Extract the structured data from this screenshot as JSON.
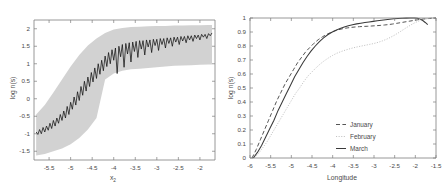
{
  "figure": {
    "title": "",
    "panels": [
      "left",
      "right"
    ]
  },
  "chart_data": [
    {
      "type": "line",
      "panel": "left",
      "title": "",
      "xlabel": "x2",
      "xlabel_display": "x",
      "xlabel_sub": "2",
      "ylabel": "log n(s)",
      "xlim": [
        -5.85,
        -1.65
      ],
      "ylim": [
        -1.75,
        2.25
      ],
      "xticks": [
        -5.5,
        -5,
        -4.5,
        -4,
        -3.5,
        -3,
        -2.5,
        -2
      ],
      "xticklabels": [
        "-5.5",
        "-5",
        "-4.5",
        "-4",
        "-3.5",
        "-3",
        "-2.5",
        "-2"
      ],
      "yticks": [
        2,
        1.5,
        1,
        0.5,
        0,
        -0.5,
        -1,
        -1.5
      ],
      "yticklabels": [
        "2",
        "1.5",
        "1",
        "0.5",
        "0",
        "-0.5",
        "-1",
        "-1.5"
      ],
      "grid": false,
      "legend": "none",
      "series": [
        {
          "name": "mean",
          "style": "solid-black-noisy",
          "x": [
            -5.8,
            -5.76,
            -5.72,
            -5.68,
            -5.64,
            -5.6,
            -5.56,
            -5.52,
            -5.48,
            -5.44,
            -5.4,
            -5.36,
            -5.32,
            -5.28,
            -5.24,
            -5.2,
            -5.16,
            -5.12,
            -5.08,
            -5.04,
            -5.0,
            -4.96,
            -4.92,
            -4.88,
            -4.84,
            -4.8,
            -4.76,
            -4.72,
            -4.68,
            -4.64,
            -4.6,
            -4.56,
            -4.52,
            -4.48,
            -4.44,
            -4.4,
            -4.36,
            -4.32,
            -4.28,
            -4.24,
            -4.2,
            -4.16,
            -4.12,
            -4.08,
            -4.04,
            -4.0,
            -3.96,
            -3.92,
            -3.88,
            -3.84,
            -3.8,
            -3.76,
            -3.72,
            -3.68,
            -3.64,
            -3.6,
            -3.56,
            -3.52,
            -3.48,
            -3.44,
            -3.4,
            -3.36,
            -3.32,
            -3.28,
            -3.24,
            -3.2,
            -3.16,
            -3.12,
            -3.08,
            -3.04,
            -3.0,
            -2.96,
            -2.92,
            -2.88,
            -2.84,
            -2.8,
            -2.76,
            -2.72,
            -2.68,
            -2.64,
            -2.6,
            -2.56,
            -2.52,
            -2.48,
            -2.44,
            -2.4,
            -2.36,
            -2.32,
            -2.28,
            -2.24,
            -2.2,
            -2.16,
            -2.12,
            -2.08,
            -2.04,
            -2.0,
            -1.96,
            -1.92,
            -1.88,
            -1.84,
            -1.8,
            -1.76,
            -1.72
          ],
          "y": [
            -0.95,
            -1.02,
            -0.88,
            -1.0,
            -0.82,
            -0.95,
            -0.78,
            -0.9,
            -0.7,
            -0.85,
            -0.62,
            -0.78,
            -0.55,
            -0.7,
            -0.45,
            -0.62,
            -0.35,
            -0.55,
            -0.22,
            -0.45,
            -0.1,
            -0.3,
            0.05,
            -0.18,
            0.2,
            -0.05,
            0.35,
            0.1,
            0.5,
            0.22,
            0.62,
            0.35,
            0.75,
            0.48,
            0.88,
            0.58,
            1.0,
            0.7,
            1.1,
            0.8,
            1.22,
            0.92,
            1.32,
            1.0,
            1.4,
            1.1,
            1.45,
            0.72,
            1.5,
            1.2,
            1.55,
            0.9,
            1.58,
            1.28,
            1.6,
            1.05,
            1.62,
            1.35,
            1.64,
            1.18,
            1.66,
            1.42,
            1.66,
            1.25,
            1.68,
            1.48,
            1.68,
            1.32,
            1.7,
            1.52,
            1.7,
            1.38,
            1.72,
            1.55,
            1.72,
            1.45,
            1.74,
            1.58,
            1.74,
            1.5,
            1.76,
            1.62,
            1.76,
            1.55,
            1.78,
            1.65,
            1.78,
            1.6,
            1.8,
            1.68,
            1.8,
            1.64,
            1.82,
            1.72,
            1.82,
            1.68,
            1.84,
            1.76,
            1.84,
            1.72,
            1.86,
            1.8,
            1.88
          ]
        },
        {
          "name": "envelope-upper",
          "style": "gray-band",
          "x": [
            -5.8,
            -5.6,
            -5.4,
            -5.2,
            -5.0,
            -4.8,
            -4.6,
            -4.4,
            -4.2,
            -4.0,
            -3.8,
            -3.6,
            -3.4,
            -3.2,
            -3.0,
            -2.8,
            -2.6,
            -2.4,
            -2.2,
            -2.0,
            -1.8,
            -1.72
          ],
          "y": [
            -0.45,
            -0.18,
            0.18,
            0.55,
            0.92,
            1.25,
            1.52,
            1.72,
            1.88,
            1.98,
            2.02,
            2.05,
            2.06,
            2.07,
            2.08,
            2.08,
            2.09,
            2.09,
            2.1,
            2.1,
            2.11,
            2.11
          ]
        },
        {
          "name": "envelope-lower",
          "style": "gray-band",
          "x": [
            -5.8,
            -5.6,
            -5.4,
            -5.2,
            -5.0,
            -4.8,
            -4.6,
            -4.4,
            -4.2,
            -4.0,
            -3.8,
            -3.6,
            -3.4,
            -3.2,
            -3.0,
            -2.8,
            -2.6,
            -2.4,
            -2.2,
            -2.0,
            -1.8,
            -1.72
          ],
          "y": [
            -1.62,
            -1.58,
            -1.5,
            -1.42,
            -1.3,
            -1.12,
            -0.88,
            -0.55,
            0.55,
            0.72,
            0.8,
            0.84,
            0.86,
            0.88,
            0.9,
            0.92,
            0.94,
            0.95,
            0.96,
            0.97,
            0.98,
            0.98
          ]
        }
      ]
    },
    {
      "type": "line",
      "panel": "right",
      "title": "",
      "xlabel": "Longitude",
      "ylabel": "log n(s)",
      "xlim": [
        -6.0,
        -1.5
      ],
      "ylim": [
        0,
        1
      ],
      "xticks": [
        -6,
        -5.5,
        -5,
        -4.5,
        -4,
        -3.5,
        -3,
        -2.5,
        -2,
        -1.5
      ],
      "xticklabels": [
        "-6",
        "-5.5",
        "-5",
        "-4.5",
        "-4",
        "-3.5",
        "-3",
        "-2.5",
        "-2",
        "-1.5"
      ],
      "yticks": [
        0,
        0.1,
        0.2,
        0.3,
        0.4,
        0.5,
        0.6,
        0.7,
        0.8,
        0.9,
        1
      ],
      "yticklabels": [
        "0",
        "0.1",
        "0.2",
        "0.3",
        "0.4",
        "0.5",
        "0.6",
        "0.7",
        "0.8",
        "0.9",
        "1"
      ],
      "grid": false,
      "legend": "lower-right",
      "legend_entries": [
        "January",
        "February",
        "March"
      ],
      "series": [
        {
          "name": "January",
          "style": "dashed",
          "color": "#555555",
          "x": [
            -5.95,
            -5.85,
            -5.75,
            -5.65,
            -5.55,
            -5.45,
            -5.35,
            -5.25,
            -5.15,
            -5.05,
            -4.95,
            -4.85,
            -4.75,
            -4.65,
            -4.55,
            -4.45,
            -4.35,
            -4.25,
            -4.15,
            -4.05,
            -3.95,
            -3.85,
            -3.75,
            -3.65,
            -3.55,
            -3.45,
            -3.35,
            -3.25,
            -3.15,
            -3.05,
            -2.95,
            -2.85,
            -2.75,
            -2.65,
            -2.55,
            -2.45,
            -2.35,
            -2.25,
            -2.15,
            -2.05,
            -1.95,
            -1.85,
            -1.75,
            -1.65,
            -1.55,
            -1.5
          ],
          "y": [
            0.0,
            0.06,
            0.13,
            0.2,
            0.27,
            0.34,
            0.41,
            0.47,
            0.53,
            0.58,
            0.63,
            0.68,
            0.72,
            0.76,
            0.79,
            0.82,
            0.845,
            0.865,
            0.882,
            0.896,
            0.908,
            0.917,
            0.924,
            0.929,
            0.933,
            0.936,
            0.938,
            0.94,
            0.941,
            0.943,
            0.945,
            0.947,
            0.95,
            0.953,
            0.957,
            0.962,
            0.967,
            0.972,
            0.977,
            0.982,
            0.987,
            0.991,
            0.994,
            0.997,
            0.999,
            1.0
          ]
        },
        {
          "name": "February",
          "style": "dotted",
          "color": "#c3c3c3",
          "x": [
            -5.9,
            -5.8,
            -5.7,
            -5.6,
            -5.5,
            -5.4,
            -5.3,
            -5.2,
            -5.1,
            -5.0,
            -4.9,
            -4.8,
            -4.7,
            -4.6,
            -4.5,
            -4.4,
            -4.3,
            -4.2,
            -4.1,
            -4.0,
            -3.9,
            -3.8,
            -3.7,
            -3.6,
            -3.5,
            -3.4,
            -3.3,
            -3.2,
            -3.1,
            -3.0,
            -2.9,
            -2.8,
            -2.7,
            -2.6,
            -2.5,
            -2.4,
            -2.3,
            -2.2,
            -2.1,
            -2.0,
            -1.9,
            -1.8,
            -1.7,
            -1.6,
            -1.5
          ],
          "y": [
            0.0,
            0.03,
            0.07,
            0.11,
            0.16,
            0.21,
            0.26,
            0.31,
            0.36,
            0.41,
            0.46,
            0.5,
            0.545,
            0.585,
            0.615,
            0.645,
            0.672,
            0.695,
            0.715,
            0.733,
            0.748,
            0.76,
            0.77,
            0.779,
            0.787,
            0.794,
            0.8,
            0.806,
            0.812,
            0.818,
            0.826,
            0.836,
            0.848,
            0.862,
            0.878,
            0.896,
            0.915,
            0.934,
            0.952,
            0.968,
            0.98,
            0.99,
            0.996,
            0.999,
            1.0
          ]
        },
        {
          "name": "March",
          "style": "solid",
          "color": "#3a3a3a",
          "x": [
            -5.92,
            -5.82,
            -5.72,
            -5.62,
            -5.52,
            -5.42,
            -5.32,
            -5.22,
            -5.12,
            -5.02,
            -4.92,
            -4.82,
            -4.72,
            -4.62,
            -4.52,
            -4.42,
            -4.32,
            -4.22,
            -4.12,
            -4.02,
            -3.92,
            -3.82,
            -3.72,
            -3.62,
            -3.52,
            -3.42,
            -3.32,
            -3.22,
            -3.12,
            -3.02,
            -2.92,
            -2.82,
            -2.72,
            -2.62,
            -2.52,
            -2.42,
            -2.32,
            -2.22,
            -2.12,
            -2.02,
            -1.95,
            -1.88,
            -1.82,
            -1.76,
            -1.7
          ],
          "y": [
            0.0,
            0.04,
            0.09,
            0.15,
            0.21,
            0.27,
            0.34,
            0.4,
            0.46,
            0.52,
            0.58,
            0.63,
            0.68,
            0.725,
            0.765,
            0.8,
            0.832,
            0.858,
            0.88,
            0.898,
            0.913,
            0.925,
            0.935,
            0.944,
            0.951,
            0.958,
            0.963,
            0.968,
            0.972,
            0.976,
            0.98,
            0.984,
            0.988,
            0.991,
            0.994,
            0.996,
            0.998,
            0.999,
            1.0,
            1.0,
            0.998,
            0.992,
            0.982,
            0.968,
            0.952
          ]
        }
      ]
    }
  ],
  "left_panel": {
    "ylabel": "log n(s)",
    "xlabel_main": "x",
    "xlabel_sub": "2",
    "yticklabels": [
      "2",
      "1.5",
      "1",
      "0.5",
      "0",
      "-0.5",
      "-1",
      "-1.5"
    ],
    "xticklabels": [
      "-5.5",
      "-5",
      "-4.5",
      "-4",
      "-3.5",
      "-3",
      "-2.5",
      "-2"
    ]
  },
  "right_panel": {
    "ylabel": "log n(s)",
    "xlabel": "Longitude",
    "yticklabels": [
      "1",
      "0.9",
      "0.8",
      "0.7",
      "0.6",
      "0.5",
      "0.4",
      "0.3",
      "0.2",
      "0.1",
      "0"
    ],
    "xticklabels": [
      "-6",
      "-5.5",
      "-5",
      "-4.5",
      "-4",
      "-3.5",
      "-3",
      "-2.5",
      "-2",
      "-1.5"
    ],
    "legend": {
      "january": "January",
      "february": "February",
      "march": "March"
    }
  },
  "colors": {
    "band": "#d2d2d2",
    "mean_line": "#111111",
    "january": "#555555",
    "february": "#c3c3c3",
    "march": "#3a3a3a",
    "axis": "#7d7d7d",
    "text": "#4a4a4a",
    "background": "#ffffff"
  }
}
